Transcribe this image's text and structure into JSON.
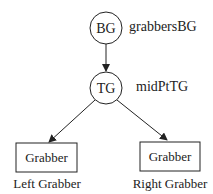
{
  "diagram": {
    "nodes": [
      {
        "id": "bg",
        "shape": "circle",
        "text": "BG",
        "label": "grabbersBG"
      },
      {
        "id": "tg",
        "shape": "circle",
        "text": "TG",
        "label": "midPtTG"
      },
      {
        "id": "left",
        "shape": "rect",
        "text": "Grabber",
        "label": "Left Grabber"
      },
      {
        "id": "right",
        "shape": "rect",
        "text": "Grabber",
        "label": "Right Grabber"
      }
    ],
    "edges": [
      {
        "from": "bg",
        "to": "tg"
      },
      {
        "from": "tg",
        "to": "left"
      },
      {
        "from": "tg",
        "to": "right"
      }
    ],
    "colors": {
      "stroke": "#222222",
      "background": "#ffffff"
    }
  }
}
